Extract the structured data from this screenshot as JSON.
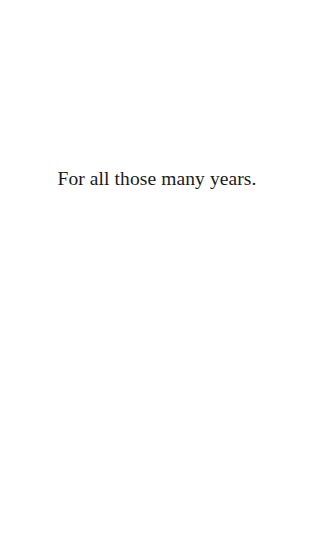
{
  "page": {
    "background_color": "#ffffff",
    "text_color": "#1a1a1a"
  },
  "dedication": {
    "text": "For all those many years."
  }
}
